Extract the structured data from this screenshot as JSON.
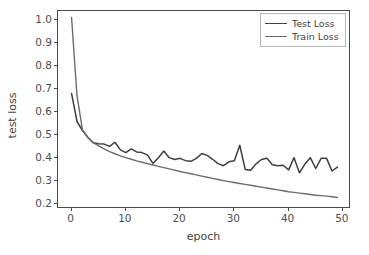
{
  "chart_data": {
    "type": "line",
    "title": "",
    "xlabel": "epoch",
    "ylabel": "test loss",
    "xlim": [
      -2.5,
      51.5
    ],
    "ylim": [
      0.18,
      1.04
    ],
    "grid": false,
    "legend_position": "upper right",
    "xticks": [
      0,
      10,
      20,
      30,
      40,
      50
    ],
    "xtick_labels": [
      "0",
      "10",
      "20",
      "30",
      "40",
      "50"
    ],
    "yticks": [
      0.2,
      0.3,
      0.4,
      0.5,
      0.6,
      0.7,
      0.8,
      0.9,
      1.0
    ],
    "ytick_labels": [
      "0.2",
      "0.3",
      "0.4",
      "0.5",
      "0.6",
      "0.7",
      "0.8",
      "0.9",
      "1.0"
    ],
    "x": [
      0,
      1,
      2,
      3,
      4,
      5,
      6,
      7,
      8,
      9,
      10,
      11,
      12,
      13,
      14,
      15,
      16,
      17,
      18,
      19,
      20,
      21,
      22,
      23,
      24,
      25,
      26,
      27,
      28,
      29,
      30,
      31,
      32,
      33,
      34,
      35,
      36,
      37,
      38,
      39,
      40,
      41,
      42,
      43,
      44,
      45,
      46,
      47,
      48,
      49
    ],
    "series": [
      {
        "name": "Test Loss",
        "color": "#3f3f3f",
        "linewidth": 1.5,
        "values": [
          0.682,
          0.56,
          0.521,
          0.492,
          0.468,
          0.463,
          0.462,
          0.452,
          0.47,
          0.437,
          0.425,
          0.441,
          0.428,
          0.425,
          0.414,
          0.378,
          0.403,
          0.432,
          0.403,
          0.395,
          0.4,
          0.39,
          0.387,
          0.4,
          0.421,
          0.413,
          0.396,
          0.377,
          0.368,
          0.385,
          0.39,
          0.457,
          0.352,
          0.348,
          0.376,
          0.395,
          0.4,
          0.372,
          0.368,
          0.37,
          0.35,
          0.403,
          0.337,
          0.375,
          0.403,
          0.356,
          0.4,
          0.4,
          0.345,
          0.362
        ]
      },
      {
        "name": "Train Loss",
        "color": "#6b6b6b",
        "linewidth": 1.4,
        "values": [
          1.012,
          0.672,
          0.525,
          0.49,
          0.468,
          0.454,
          0.441,
          0.429,
          0.42,
          0.411,
          0.403,
          0.396,
          0.389,
          0.383,
          0.377,
          0.371,
          0.365,
          0.36,
          0.354,
          0.349,
          0.343,
          0.338,
          0.333,
          0.328,
          0.323,
          0.318,
          0.313,
          0.308,
          0.303,
          0.299,
          0.295,
          0.291,
          0.287,
          0.283,
          0.279,
          0.275,
          0.271,
          0.267,
          0.263,
          0.259,
          0.255,
          0.252,
          0.249,
          0.246,
          0.243,
          0.24,
          0.238,
          0.236,
          0.233,
          0.23
        ]
      }
    ]
  },
  "legend": {
    "entries": [
      {
        "label": "Test Loss"
      },
      {
        "label": "Train Loss"
      }
    ]
  },
  "axes": {
    "frame_color": "#4a4a4a",
    "tick_color": "#4d4d4d"
  }
}
